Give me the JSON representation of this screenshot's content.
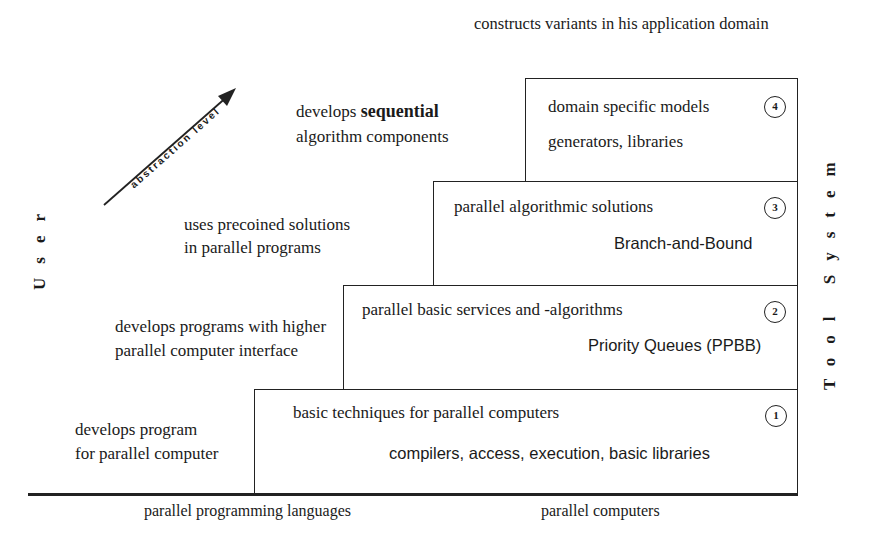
{
  "diagram": {
    "side_labels": {
      "left": "User",
      "right": "Tool System"
    },
    "arrow": {
      "label": "abstraction level"
    },
    "top_annotation": "constructs variants in his application domain",
    "user_annotations": [
      {
        "level": 4,
        "line1_prefix": "develops",
        "line1_bold": "sequential",
        "line2": "algorithm components"
      },
      {
        "level": 3,
        "line1": "uses precoined solutions",
        "line2": "in parallel programs"
      },
      {
        "level": 2,
        "line1": "develops programs with higher",
        "line2": "parallel computer interface"
      },
      {
        "level": 1,
        "line1": "develops program",
        "line2": "for parallel computer"
      }
    ],
    "levels": [
      {
        "number": "4",
        "title": "domain specific models",
        "example": "generators, libraries"
      },
      {
        "number": "3",
        "title": "parallel algorithmic solutions",
        "example": "Branch-and-Bound"
      },
      {
        "number": "2",
        "title": "parallel basic services and -algorithms",
        "example": "Priority Queues (PPBB)"
      },
      {
        "number": "1",
        "title": "basic techniques for parallel computers",
        "example": "compilers, access, execution, basic libraries"
      }
    ],
    "base_labels": {
      "left": "parallel programming languages",
      "right": "parallel computers"
    }
  }
}
